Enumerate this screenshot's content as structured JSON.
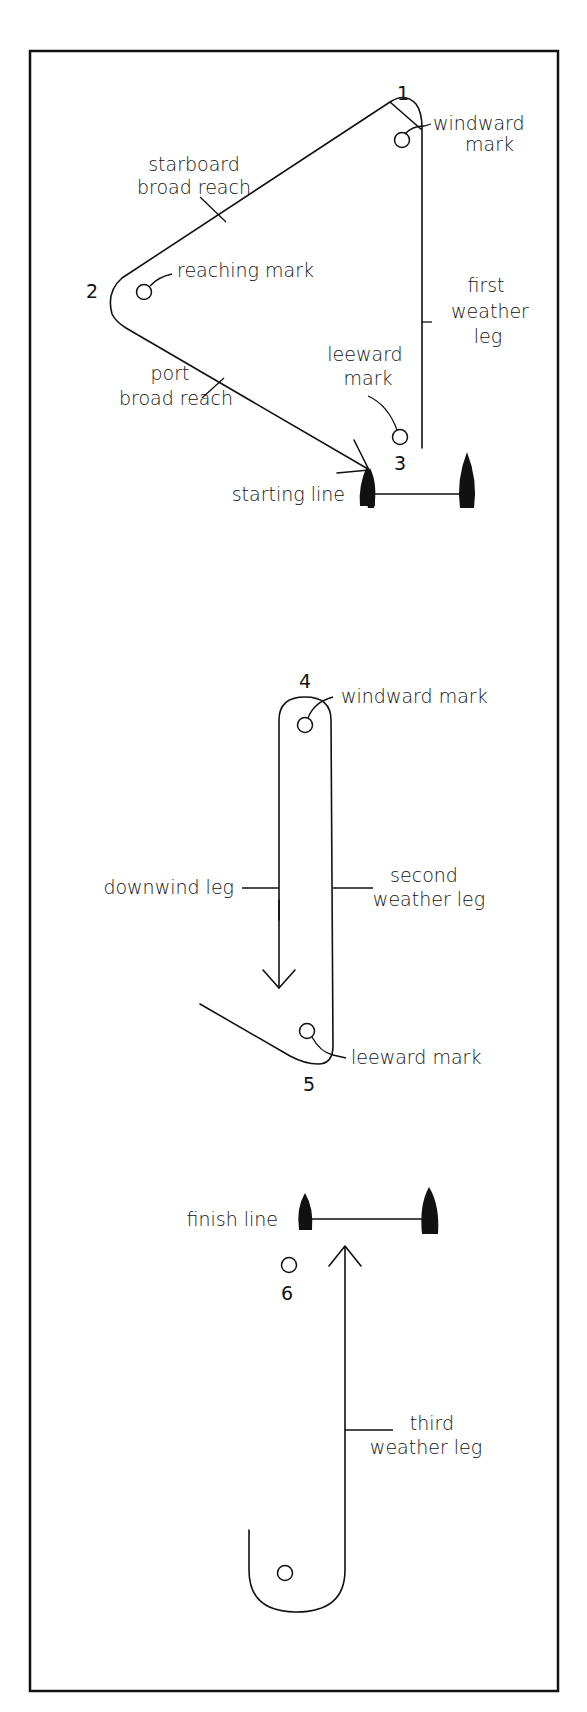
{
  "diagram": {
    "section1": {
      "mark_numbers": {
        "n1": "1",
        "n2": "2",
        "n3": "3"
      },
      "labels": {
        "windward_mark_1": "windward",
        "windward_mark_2": "mark",
        "starboard_1": "starboard",
        "starboard_2": "broad reach",
        "reaching_mark": "reaching mark",
        "first_leg_1": "first",
        "first_leg_2": "weather",
        "first_leg_3": "leg",
        "leeward_mark_1": "leeward",
        "leeward_mark_2": "mark",
        "port_1": "port",
        "port_2": "broad reach",
        "starting_line": "starting line"
      }
    },
    "section2": {
      "mark_numbers": {
        "n4": "4",
        "n5": "5"
      },
      "labels": {
        "windward_mark": "windward mark",
        "downwind_leg": "downwind leg",
        "second_leg_1": "second",
        "second_leg_2": "weather leg",
        "leeward_mark": "leeward mark"
      }
    },
    "section3": {
      "mark_numbers": {
        "n6": "6"
      },
      "labels": {
        "finish_line": "finish line",
        "third_leg_1": "third",
        "third_leg_2": "weather leg"
      }
    },
    "colors": {
      "ink": "#111111",
      "background": "#ffffff"
    }
  }
}
